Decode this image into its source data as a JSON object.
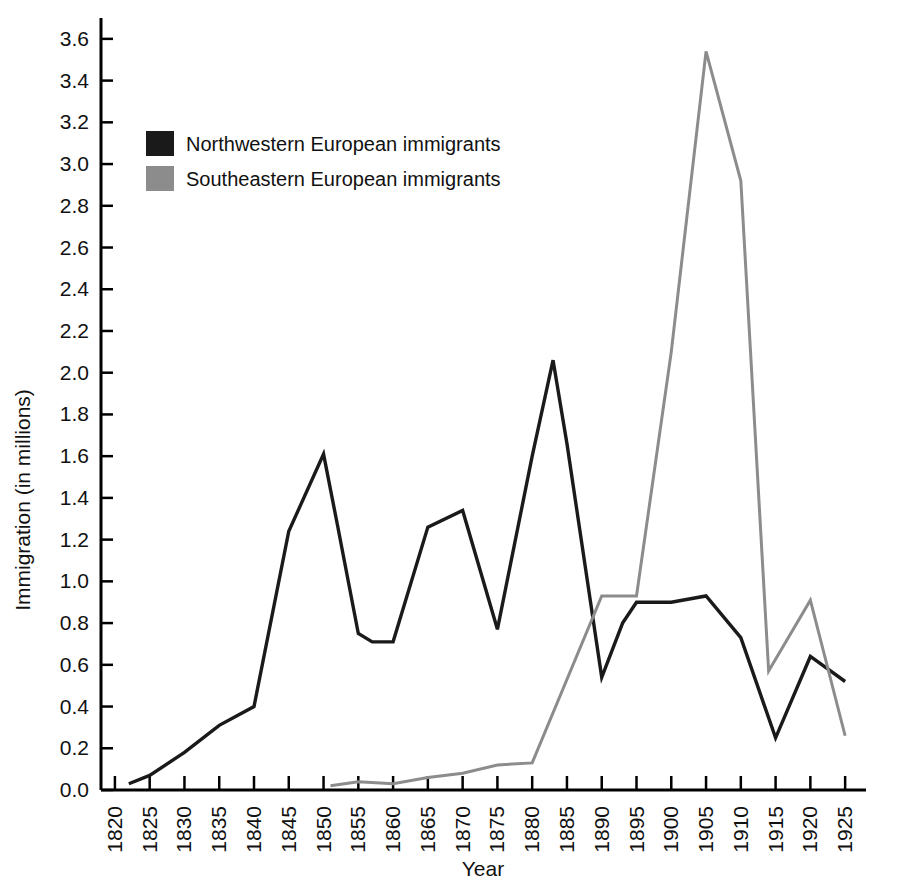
{
  "chart_data": {
    "type": "line",
    "title": "",
    "xlabel": "Year",
    "ylabel": "Immigration (in millions)",
    "xlim": [
      1818,
      1928
    ],
    "ylim": [
      0.0,
      3.7
    ],
    "grid": false,
    "legend_position": "upper-left-inside",
    "x_tick_labels": [
      "1820",
      "1825",
      "1830",
      "1835",
      "1840",
      "1845",
      "1850",
      "1855",
      "1860",
      "1865",
      "1870",
      "1875",
      "1880",
      "1885",
      "1890",
      "1895",
      "1900",
      "1905",
      "1910",
      "1915",
      "1920",
      "1925"
    ],
    "y_tick_labels": [
      "0.0",
      "0.2",
      "0.4",
      "0.6",
      "0.8",
      "1.0",
      "1.2",
      "1.4",
      "1.6",
      "1.8",
      "2.0",
      "2.2",
      "2.4",
      "2.6",
      "2.8",
      "3.0",
      "3.2",
      "3.4",
      "3.6"
    ],
    "y_tick_values": [
      0.0,
      0.2,
      0.4,
      0.6,
      0.8,
      1.0,
      1.2,
      1.4,
      1.6,
      1.8,
      2.0,
      2.2,
      2.4,
      2.6,
      2.8,
      3.0,
      3.2,
      3.4,
      3.6
    ],
    "series": [
      {
        "name": "Northwestern European immigrants",
        "color": "#1a1a1a",
        "stroke_width": 3.4,
        "x": [
          1822,
          1825,
          1830,
          1835,
          1840,
          1845,
          1850,
          1852,
          1855,
          1857,
          1860,
          1865,
          1870,
          1875,
          1880,
          1883,
          1885,
          1890,
          1893,
          1895,
          1900,
          1905,
          1910,
          1915,
          1920,
          1925
        ],
        "y": [
          0.03,
          0.07,
          0.18,
          0.31,
          0.4,
          1.24,
          1.61,
          1.27,
          0.75,
          0.71,
          0.71,
          1.26,
          1.34,
          0.77,
          1.6,
          2.06,
          1.66,
          0.54,
          0.8,
          0.9,
          0.9,
          0.93,
          0.73,
          0.25,
          0.64,
          0.52
        ]
      },
      {
        "name": "Southeastern European immigrants",
        "color": "#8c8c8c",
        "stroke_width": 3.0,
        "x": [
          1851,
          1855,
          1860,
          1865,
          1870,
          1875,
          1880,
          1890,
          1895,
          1900,
          1905,
          1910,
          1914,
          1920,
          1925
        ],
        "y": [
          0.02,
          0.04,
          0.03,
          0.06,
          0.08,
          0.12,
          0.13,
          0.93,
          0.93,
          2.1,
          3.54,
          2.92,
          0.57,
          0.91,
          0.26
        ]
      }
    ]
  },
  "legend": {
    "items": [
      {
        "label": "Northwestern European immigrants",
        "color": "#1a1a1a"
      },
      {
        "label": "Southeastern European immigrants",
        "color": "#8c8c8c"
      }
    ]
  },
  "axes": {
    "x_title": "Year",
    "y_title": "Immigration (in millions)"
  }
}
